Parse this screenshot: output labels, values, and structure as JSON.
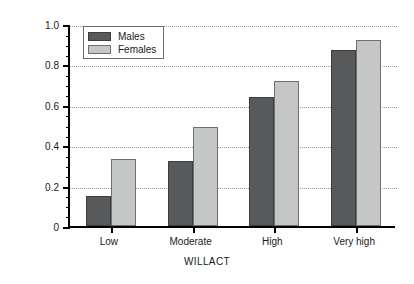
{
  "chart_data": {
    "type": "bar",
    "title": "",
    "subtitle": "",
    "xlabel": "WILLACT",
    "ylabel": "Support Groups (mean)",
    "categories": [
      "Low",
      "Moderate",
      "High",
      "Very high"
    ],
    "series": [
      {
        "name": "Males",
        "color": "#58595B",
        "values": [
          0.15,
          0.32,
          0.64,
          0.87
        ]
      },
      {
        "name": "Females",
        "color": "#C5C6C6",
        "values": [
          0.33,
          0.49,
          0.72,
          0.92
        ]
      }
    ],
    "ylim": [
      0,
      1.0
    ],
    "ytick_labels": [
      "0",
      "0.2",
      "0.4",
      "0.6",
      "0.8",
      "1.0"
    ],
    "ytick_values": [
      0,
      0.2,
      0.4,
      0.6,
      0.8,
      1.0
    ],
    "yminor_step": 0.05,
    "grid": true,
    "grid_style": "dotted",
    "grid_color": "#9A9A9A",
    "legend_position": "top-left-inside",
    "axis_color": "#000000",
    "background": "#FFFFFF"
  },
  "legend": {
    "entries": [
      {
        "label": "Males"
      },
      {
        "label": "Females"
      }
    ]
  }
}
